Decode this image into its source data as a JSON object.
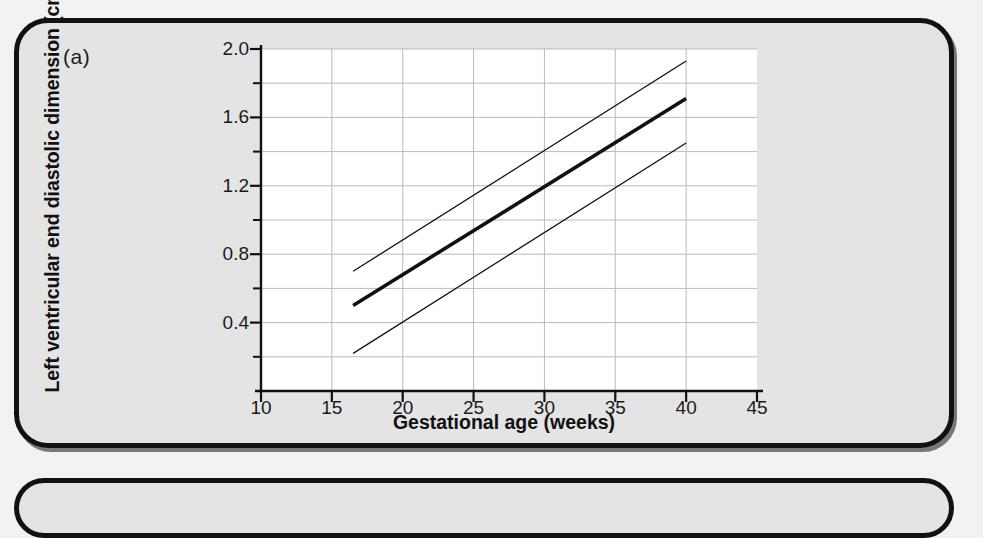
{
  "panel": {
    "label": "(a)",
    "second_panel_label": ""
  },
  "chart_data": {
    "type": "line",
    "title": "",
    "subtitle": "",
    "xlabel": "Gestational age (weeks)",
    "ylabel": "Left ventricular end diastolic dimension (cm)",
    "xlim": [
      10,
      45
    ],
    "ylim": [
      0.0,
      2.0
    ],
    "xticks": [
      10,
      15,
      20,
      25,
      30,
      35,
      40,
      45
    ],
    "xtick_labels": [
      "10",
      "15",
      "20",
      "25",
      "30",
      "35",
      "40",
      "45"
    ],
    "yticks": [
      0.4,
      0.8,
      1.2,
      1.6,
      2.0
    ],
    "ytick_labels": [
      "0.4",
      "0.8",
      "1.2",
      "1.6",
      "2.0"
    ],
    "y_minor_ticks": [
      0.2,
      0.6,
      1.0,
      1.4,
      1.8
    ],
    "grid": {
      "horizontal": true,
      "vertical": true,
      "horizontal_step": 0.2,
      "vertical_step": 5,
      "color": "#b9b9c4"
    },
    "legend": {
      "visible": false,
      "position": "none"
    },
    "plot_background": "#ffffff",
    "line_color": "#111111",
    "series": [
      {
        "name": "upper limit",
        "style": "thin",
        "width_px": 1.3,
        "x": [
          16.5,
          40
        ],
        "values": [
          0.7,
          1.93
        ]
      },
      {
        "name": "mean",
        "style": "thick",
        "width_px": 3.6,
        "x": [
          16.5,
          40
        ],
        "values": [
          0.5,
          1.71
        ]
      },
      {
        "name": "lower limit",
        "style": "thin",
        "width_px": 1.3,
        "x": [
          16.5,
          40
        ],
        "values": [
          0.22,
          1.45
        ]
      }
    ]
  }
}
